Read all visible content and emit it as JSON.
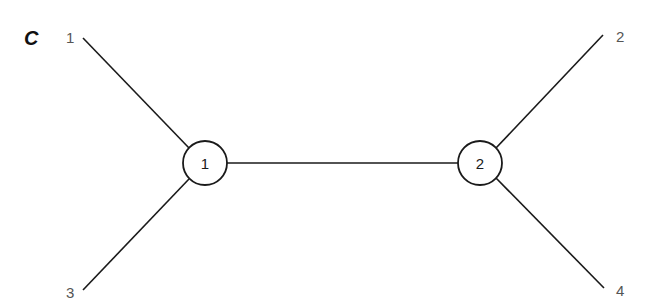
{
  "panel_label": "C",
  "internal_nodes": [
    {
      "id": "1",
      "label": "1",
      "cx": 205,
      "cy": 163,
      "r": 22
    },
    {
      "id": "2",
      "label": "2",
      "cx": 480,
      "cy": 163,
      "r": 22
    }
  ],
  "leaves": [
    {
      "label": "1",
      "x": 83,
      "y": 38,
      "label_x": 70,
      "label_y": 43,
      "attached_to": "1"
    },
    {
      "label": "3",
      "x": 83,
      "y": 290,
      "label_x": 73,
      "label_y": 298,
      "attached_to": "1"
    },
    {
      "label": "2",
      "x": 603,
      "y": 35,
      "label_x": 620,
      "label_y": 42,
      "attached_to": "2"
    },
    {
      "label": "4",
      "x": 604,
      "y": 288,
      "label_x": 620,
      "label_y": 296,
      "attached_to": "2"
    }
  ],
  "internal_edge": {
    "from": "1",
    "to": "2"
  },
  "colors": {
    "line": "#1a1a1a",
    "leaf_text": "#555555",
    "background": "#ffffff"
  }
}
